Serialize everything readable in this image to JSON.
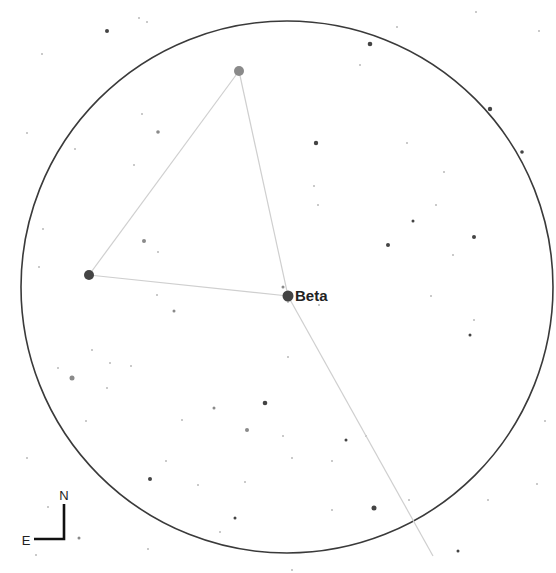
{
  "chart_title": "Star chart finder view",
  "field_of_view": {
    "cx": 287,
    "cy": 287,
    "r": 266,
    "stroke": "#3a3a3a"
  },
  "labels": {
    "beta": "Beta",
    "north": "N",
    "east": "E"
  },
  "colors": {
    "background": "#ffffff",
    "constellation_line": "#cfcfcf",
    "star_dark": "#444444",
    "star_mid": "#8a8a8a",
    "star_faint": "#b8b8b8",
    "label": "#222222"
  },
  "named_stars": [
    {
      "name": "Beta",
      "x": 288,
      "y": 296,
      "r": 5.5,
      "color": "#444444",
      "labeled": true
    },
    {
      "name": "",
      "x": 239,
      "y": 71,
      "r": 5,
      "color": "#8a8a8a",
      "labeled": false
    },
    {
      "name": "",
      "x": 89,
      "y": 275,
      "r": 5,
      "color": "#444444",
      "labeled": false
    }
  ],
  "constellation_lines": [
    {
      "x1": 239,
      "y1": 71,
      "x2": 89,
      "y2": 275
    },
    {
      "x1": 89,
      "y1": 275,
      "x2": 288,
      "y2": 296
    },
    {
      "x1": 239,
      "y1": 71,
      "x2": 288,
      "y2": 296
    },
    {
      "x1": 288,
      "y1": 296,
      "x2": 433,
      "y2": 556
    }
  ],
  "stars": [
    {
      "x": 107,
      "y": 31,
      "r": 2,
      "c": "#444444"
    },
    {
      "x": 139,
      "y": 18,
      "r": 1,
      "c": "#b8b8b8"
    },
    {
      "x": 147,
      "y": 22,
      "r": 1,
      "c": "#b8b8b8"
    },
    {
      "x": 42,
      "y": 54,
      "r": 1,
      "c": "#b8b8b8"
    },
    {
      "x": 370,
      "y": 44,
      "r": 2.3,
      "c": "#444444"
    },
    {
      "x": 397,
      "y": 27,
      "r": 1,
      "c": "#b8b8b8"
    },
    {
      "x": 476,
      "y": 12,
      "r": 1,
      "c": "#b8b8b8"
    },
    {
      "x": 539,
      "y": 31,
      "r": 1,
      "c": "#b8b8b8"
    },
    {
      "x": 360,
      "y": 65,
      "r": 1,
      "c": "#b8b8b8"
    },
    {
      "x": 490,
      "y": 109,
      "r": 2.2,
      "c": "#444444"
    },
    {
      "x": 522,
      "y": 152,
      "r": 1.8,
      "c": "#444444"
    },
    {
      "x": 316,
      "y": 143,
      "r": 2.2,
      "c": "#444444"
    },
    {
      "x": 158,
      "y": 132,
      "r": 1.8,
      "c": "#8a8a8a"
    },
    {
      "x": 142,
      "y": 114,
      "r": 1,
      "c": "#b8b8b8"
    },
    {
      "x": 27,
      "y": 133,
      "r": 1,
      "c": "#b8b8b8"
    },
    {
      "x": 75,
      "y": 149,
      "r": 1,
      "c": "#b8b8b8"
    },
    {
      "x": 134,
      "y": 165,
      "r": 1,
      "c": "#b8b8b8"
    },
    {
      "x": 144,
      "y": 241,
      "r": 2,
      "c": "#8a8a8a"
    },
    {
      "x": 158,
      "y": 252,
      "r": 1,
      "c": "#b8b8b8"
    },
    {
      "x": 43,
      "y": 229,
      "r": 1,
      "c": "#b8b8b8"
    },
    {
      "x": 39,
      "y": 267,
      "r": 1,
      "c": "#b8b8b8"
    },
    {
      "x": 314,
      "y": 186,
      "r": 1,
      "c": "#b8b8b8"
    },
    {
      "x": 407,
      "y": 143,
      "r": 1,
      "c": "#b8b8b8"
    },
    {
      "x": 444,
      "y": 172,
      "r": 1,
      "c": "#b8b8b8"
    },
    {
      "x": 388,
      "y": 245,
      "r": 2,
      "c": "#444444"
    },
    {
      "x": 413,
      "y": 221,
      "r": 1.5,
      "c": "#444444"
    },
    {
      "x": 474,
      "y": 237,
      "r": 2,
      "c": "#444444"
    },
    {
      "x": 453,
      "y": 255,
      "r": 1,
      "c": "#b8b8b8"
    },
    {
      "x": 318,
      "y": 205,
      "r": 1,
      "c": "#b8b8b8"
    },
    {
      "x": 436,
      "y": 205,
      "r": 1,
      "c": "#b8b8b8"
    },
    {
      "x": 283,
      "y": 287,
      "r": 1.5,
      "c": "#8a8a8a"
    },
    {
      "x": 174,
      "y": 311,
      "r": 1.5,
      "c": "#8a8a8a"
    },
    {
      "x": 157,
      "y": 295,
      "r": 1,
      "c": "#b8b8b8"
    },
    {
      "x": 470,
      "y": 335,
      "r": 1.5,
      "c": "#444444"
    },
    {
      "x": 474,
      "y": 320,
      "r": 1,
      "c": "#b8b8b8"
    },
    {
      "x": 431,
      "y": 296,
      "r": 1,
      "c": "#b8b8b8"
    },
    {
      "x": 288,
      "y": 357,
      "r": 1,
      "c": "#b8b8b8"
    },
    {
      "x": 72,
      "y": 378,
      "r": 2.5,
      "c": "#8a8a8a"
    },
    {
      "x": 58,
      "y": 368,
      "r": 1,
      "c": "#b8b8b8"
    },
    {
      "x": 92,
      "y": 350,
      "r": 1,
      "c": "#b8b8b8"
    },
    {
      "x": 110,
      "y": 363,
      "r": 1,
      "c": "#b8b8b8"
    },
    {
      "x": 107,
      "y": 388,
      "r": 1,
      "c": "#b8b8b8"
    },
    {
      "x": 131,
      "y": 366,
      "r": 1,
      "c": "#b8b8b8"
    },
    {
      "x": 86,
      "y": 421,
      "r": 1,
      "c": "#b8b8b8"
    },
    {
      "x": 214,
      "y": 408,
      "r": 1.5,
      "c": "#8a8a8a"
    },
    {
      "x": 182,
      "y": 420,
      "r": 1,
      "c": "#b8b8b8"
    },
    {
      "x": 265,
      "y": 403,
      "r": 2.3,
      "c": "#444444"
    },
    {
      "x": 247,
      "y": 430,
      "r": 2,
      "c": "#8a8a8a"
    },
    {
      "x": 283,
      "y": 436,
      "r": 1,
      "c": "#b8b8b8"
    },
    {
      "x": 346,
      "y": 440,
      "r": 1.5,
      "c": "#444444"
    },
    {
      "x": 366,
      "y": 436,
      "r": 1,
      "c": "#b8b8b8"
    },
    {
      "x": 332,
      "y": 461,
      "r": 1,
      "c": "#b8b8b8"
    },
    {
      "x": 150,
      "y": 479,
      "r": 2,
      "c": "#444444"
    },
    {
      "x": 166,
      "y": 461,
      "r": 1,
      "c": "#b8b8b8"
    },
    {
      "x": 198,
      "y": 485,
      "r": 1,
      "c": "#b8b8b8"
    },
    {
      "x": 245,
      "y": 482,
      "r": 1,
      "c": "#b8b8b8"
    },
    {
      "x": 374,
      "y": 508,
      "r": 2.5,
      "c": "#444444"
    },
    {
      "x": 332,
      "y": 510,
      "r": 1,
      "c": "#b8b8b8"
    },
    {
      "x": 235,
      "y": 518,
      "r": 1.5,
      "c": "#444444"
    },
    {
      "x": 220,
      "y": 532,
      "r": 1,
      "c": "#b8b8b8"
    },
    {
      "x": 148,
      "y": 549,
      "r": 1,
      "c": "#b8b8b8"
    },
    {
      "x": 36,
      "y": 555,
      "r": 1,
      "c": "#b8b8b8"
    },
    {
      "x": 27,
      "y": 458,
      "r": 1,
      "c": "#b8b8b8"
    },
    {
      "x": 48,
      "y": 507,
      "r": 1,
      "c": "#b8b8b8"
    },
    {
      "x": 79,
      "y": 538,
      "r": 1.5,
      "c": "#8a8a8a"
    },
    {
      "x": 288,
      "y": 302,
      "r": 1,
      "c": "#b8b8b8"
    },
    {
      "x": 319,
      "y": 305,
      "r": 1,
      "c": "#b8b8b8"
    },
    {
      "x": 409,
      "y": 500,
      "r": 1,
      "c": "#b8b8b8"
    },
    {
      "x": 458,
      "y": 551,
      "r": 1.5,
      "c": "#444444"
    },
    {
      "x": 488,
      "y": 500,
      "r": 1,
      "c": "#b8b8b8"
    },
    {
      "x": 545,
      "y": 421,
      "r": 1,
      "c": "#b8b8b8"
    },
    {
      "x": 537,
      "y": 484,
      "r": 1,
      "c": "#b8b8b8"
    },
    {
      "x": 292,
      "y": 570,
      "r": 1,
      "c": "#b8b8b8"
    },
    {
      "x": 292,
      "y": 458,
      "r": 1,
      "c": "#b8b8b8"
    }
  ],
  "compass": {
    "origin": {
      "x": 64,
      "y": 539
    },
    "north_end": {
      "x": 64,
      "y": 504
    },
    "east_end": {
      "x": 34,
      "y": 539
    },
    "n_label_pos": {
      "x": 64,
      "y": 500
    },
    "e_label_pos": {
      "x": 26,
      "y": 545
    }
  }
}
